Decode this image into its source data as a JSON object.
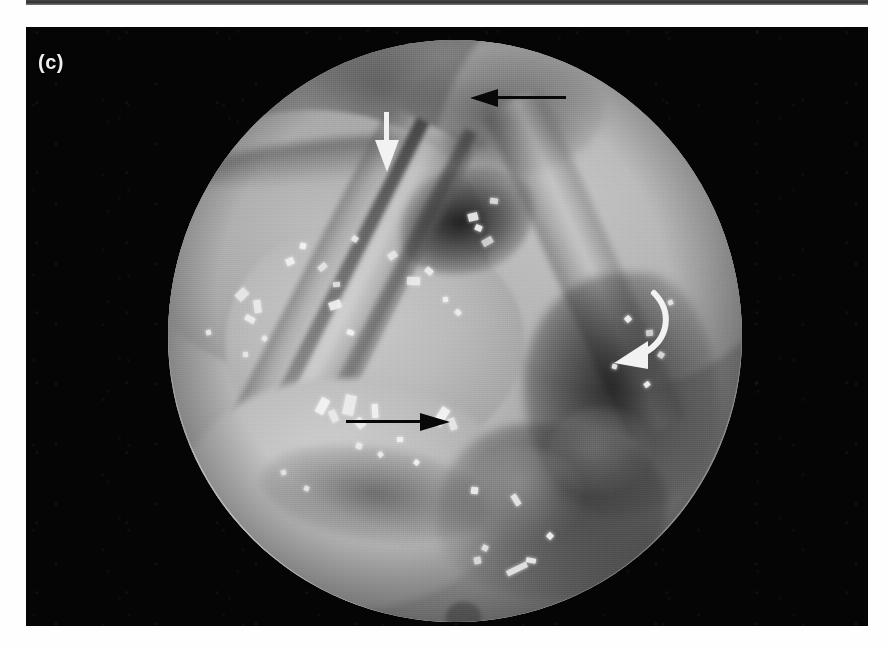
{
  "figure": {
    "panel_label": "(c)",
    "modality": "endoscopic-photograph",
    "background_color": "#050505",
    "page_background": "#ffffff",
    "top_strip_present": true
  },
  "scope": {
    "field_shape": "circle",
    "field_color_light": "#c9c9c9",
    "field_color_mid": "#a2a2a2",
    "field_color_dark": "#8b8b8b",
    "vignette": true,
    "bottom_nub": true
  },
  "annotations": [
    {
      "id": "arrow-black-top",
      "type": "straight-arrow",
      "color": "#080808",
      "direction": "left",
      "x": 470,
      "y": 90,
      "length": 92
    },
    {
      "id": "arrow-white-top",
      "type": "straight-arrow",
      "color": "#f2f2f2",
      "direction": "down",
      "x": 382,
      "y": 112,
      "length": 58
    },
    {
      "id": "arrow-white-curved",
      "type": "curved-arrow",
      "color": "#f2f2f2",
      "direction": "down-left",
      "x": 596,
      "y": 282,
      "length": 72
    },
    {
      "id": "arrow-black-bottom",
      "type": "straight-arrow",
      "color": "#080808",
      "direction": "right",
      "x": 348,
      "y": 422,
      "length": 100
    }
  ],
  "highlights": [
    {
      "x": 236,
      "y": 290,
      "w": 12,
      "h": 9
    },
    {
      "x": 254,
      "y": 300,
      "w": 7,
      "h": 13
    },
    {
      "x": 245,
      "y": 316,
      "w": 10,
      "h": 6
    },
    {
      "x": 286,
      "y": 258,
      "w": 8,
      "h": 7
    },
    {
      "x": 300,
      "y": 243,
      "w": 6,
      "h": 6
    },
    {
      "x": 318,
      "y": 264,
      "w": 9,
      "h": 6
    },
    {
      "x": 333,
      "y": 282,
      "w": 7,
      "h": 5
    },
    {
      "x": 352,
      "y": 236,
      "w": 6,
      "h": 6
    },
    {
      "x": 329,
      "y": 301,
      "w": 12,
      "h": 8
    },
    {
      "x": 347,
      "y": 330,
      "w": 7,
      "h": 5
    },
    {
      "x": 388,
      "y": 252,
      "w": 9,
      "h": 7
    },
    {
      "x": 407,
      "y": 277,
      "w": 13,
      "h": 8
    },
    {
      "x": 425,
      "y": 268,
      "w": 8,
      "h": 6
    },
    {
      "x": 468,
      "y": 213,
      "w": 10,
      "h": 8
    },
    {
      "x": 475,
      "y": 225,
      "w": 7,
      "h": 6
    },
    {
      "x": 482,
      "y": 238,
      "w": 11,
      "h": 7
    },
    {
      "x": 490,
      "y": 198,
      "w": 8,
      "h": 6
    },
    {
      "x": 455,
      "y": 310,
      "w": 6,
      "h": 5
    },
    {
      "x": 443,
      "y": 297,
      "w": 5,
      "h": 5
    },
    {
      "x": 318,
      "y": 398,
      "w": 9,
      "h": 16
    },
    {
      "x": 330,
      "y": 410,
      "w": 7,
      "h": 12
    },
    {
      "x": 344,
      "y": 395,
      "w": 11,
      "h": 20
    },
    {
      "x": 356,
      "y": 418,
      "w": 8,
      "h": 10
    },
    {
      "x": 372,
      "y": 404,
      "w": 6,
      "h": 14
    },
    {
      "x": 437,
      "y": 407,
      "w": 9,
      "h": 19
    },
    {
      "x": 449,
      "y": 418,
      "w": 7,
      "h": 12
    },
    {
      "x": 356,
      "y": 443,
      "w": 6,
      "h": 6
    },
    {
      "x": 378,
      "y": 452,
      "w": 5,
      "h": 5
    },
    {
      "x": 397,
      "y": 437,
      "w": 6,
      "h": 5
    },
    {
      "x": 414,
      "y": 460,
      "w": 5,
      "h": 5
    },
    {
      "x": 281,
      "y": 470,
      "w": 5,
      "h": 5
    },
    {
      "x": 304,
      "y": 486,
      "w": 5,
      "h": 5
    },
    {
      "x": 513,
      "y": 494,
      "w": 6,
      "h": 12
    },
    {
      "x": 471,
      "y": 487,
      "w": 7,
      "h": 7
    },
    {
      "x": 547,
      "y": 533,
      "w": 6,
      "h": 6
    },
    {
      "x": 474,
      "y": 557,
      "w": 7,
      "h": 7
    },
    {
      "x": 482,
      "y": 545,
      "w": 6,
      "h": 6
    },
    {
      "x": 506,
      "y": 566,
      "w": 22,
      "h": 6
    },
    {
      "x": 526,
      "y": 558,
      "w": 10,
      "h": 5
    },
    {
      "x": 625,
      "y": 316,
      "w": 6,
      "h": 6
    },
    {
      "x": 646,
      "y": 330,
      "w": 7,
      "h": 6
    },
    {
      "x": 658,
      "y": 352,
      "w": 6,
      "h": 6
    },
    {
      "x": 668,
      "y": 300,
      "w": 5,
      "h": 5
    },
    {
      "x": 612,
      "y": 364,
      "w": 5,
      "h": 5
    },
    {
      "x": 644,
      "y": 382,
      "w": 6,
      "h": 5
    },
    {
      "x": 243,
      "y": 352,
      "w": 5,
      "h": 5
    },
    {
      "x": 262,
      "y": 336,
      "w": 5,
      "h": 5
    },
    {
      "x": 206,
      "y": 330,
      "w": 5,
      "h": 5
    }
  ]
}
